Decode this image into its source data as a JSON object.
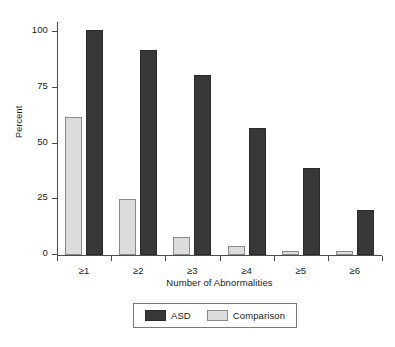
{
  "chart_data": {
    "type": "bar",
    "title": "",
    "subtitle": "",
    "xlabel": "Number of Abnormalities",
    "ylabel": "Percent",
    "categories": [
      "≥1",
      "≥2",
      "≥3",
      "≥4",
      "≥5",
      "≥6"
    ],
    "series": [
      {
        "name": "Comparison",
        "color": "#dcdcdc",
        "values": [
          62,
          25,
          8,
          4,
          2,
          2
        ]
      },
      {
        "name": "ASD",
        "color": "#383838",
        "values": [
          101,
          92,
          81,
          57,
          39,
          20
        ]
      }
    ],
    "series_draw_order": [
      "Comparison",
      "ASD"
    ],
    "ylim": [
      0,
      105
    ],
    "yticks": [
      0,
      25,
      50,
      75,
      100
    ],
    "ytick_labels": [
      "0",
      "25",
      "50",
      "75",
      "100"
    ],
    "grid": false,
    "legend_position": "bottom",
    "legend_order": [
      "ASD",
      "Comparison"
    ]
  },
  "axes": {
    "y_label": "Percent",
    "x_label": "Number of Abnormalities",
    "y_ticks": [
      "0",
      "25",
      "50",
      "75",
      "100"
    ],
    "x_ticks": [
      "≥1",
      "≥2",
      "≥3",
      "≥4",
      "≥5",
      "≥6"
    ]
  },
  "legend": {
    "entries": [
      {
        "label": "ASD",
        "color": "#383838"
      },
      {
        "label": "Comparison",
        "color": "#dcdcdc"
      }
    ]
  },
  "colors": {
    "asd": "#383838",
    "comparison": "#dcdcdc",
    "axis": "#4d4d4d",
    "text": "#1a1a1a",
    "background": "#ffffff"
  }
}
